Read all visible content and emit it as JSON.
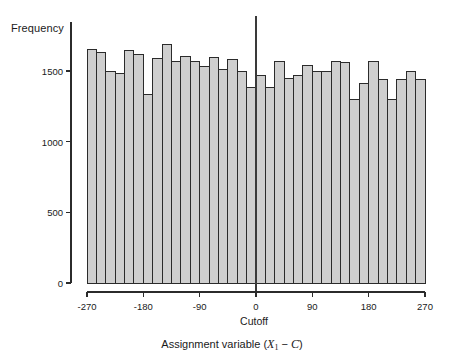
{
  "chart_data": {
    "type": "bar",
    "title": "",
    "subtitle": "",
    "xlabel": "Assignment variable (X₁ − C)",
    "xlabel_parts": {
      "prefix": "Assignment variable (",
      "var": "X",
      "sub": "1",
      "minus": " − ",
      "cutoff_var": "C",
      "suffix": ")"
    },
    "ylabel": "Frequency",
    "cutoff_label": "Cutoff",
    "cutoff_value": 0,
    "grid": false,
    "legend": null,
    "xlim": [
      -270,
      270
    ],
    "ylim": [
      0,
      1760
    ],
    "xticks": [
      -270,
      -180,
      -90,
      0,
      90,
      180,
      270
    ],
    "xtick_labels": [
      "-270",
      "-180",
      "-90",
      "0",
      "90",
      "180",
      "270"
    ],
    "yticks": [
      0,
      500,
      1000,
      1500
    ],
    "ytick_labels": [
      "0",
      "500",
      "1000",
      "1500"
    ],
    "bin_width": 15,
    "bin_starts": [
      -270,
      -255,
      -240,
      -225,
      -210,
      -195,
      -180,
      -165,
      -150,
      -135,
      -120,
      -105,
      -90,
      -75,
      -60,
      -45,
      -30,
      -15,
      0,
      15,
      30,
      45,
      60,
      75,
      90,
      105,
      120,
      135,
      150,
      165,
      180,
      195,
      210,
      225,
      240,
      255
    ],
    "categories": [
      "-270",
      "-255",
      "-240",
      "-225",
      "-210",
      "-195",
      "-180",
      "-165",
      "-150",
      "-135",
      "-120",
      "-105",
      "-90",
      "-75",
      "-60",
      "-45",
      "-30",
      "-15",
      "0",
      "15",
      "30",
      "45",
      "60",
      "75",
      "90",
      "105",
      "120",
      "135",
      "150",
      "165",
      "180",
      "195",
      "210",
      "225",
      "240",
      "255"
    ],
    "values": [
      1655,
      1630,
      1500,
      1485,
      1645,
      1615,
      1335,
      1585,
      1690,
      1565,
      1605,
      1565,
      1530,
      1595,
      1510,
      1580,
      1495,
      1380,
      1465,
      1380,
      1570,
      1445,
      1470,
      1540,
      1500,
      1495,
      1570,
      1560,
      1300,
      1415,
      1570,
      1440,
      1300,
      1440,
      1495,
      1440
    ],
    "bar_fill": "#cfcfcf",
    "bar_stroke": "#2b2b2b",
    "axis_color": "#2b2b2b",
    "background": "#ffffff"
  }
}
